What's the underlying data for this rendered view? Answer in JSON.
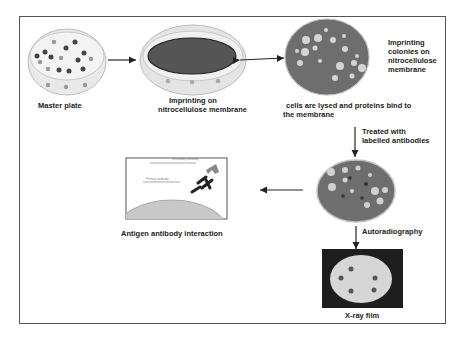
{
  "diagram": {
    "steps": [
      {
        "id": "master",
        "label": "Master plate"
      },
      {
        "id": "imprint",
        "label_line1": "Imprinting on",
        "label_line2": "nitrocellulose membrane"
      },
      {
        "id": "colonies",
        "label_lines": [
          "Imprinting",
          "colonies on",
          "nitrocellulose",
          "membrane"
        ]
      },
      {
        "id": "lysis",
        "label_line1": "cells are lysed and proteins bind to",
        "label_line2": "the membrane"
      },
      {
        "id": "antibodies",
        "label_line1": "Treated with",
        "label_line2": "labelled antibodies"
      },
      {
        "id": "autorad",
        "label": "Autoradiography"
      },
      {
        "id": "xray",
        "label": "X-ray film"
      },
      {
        "id": "interaction",
        "label": "Antigen antibody interaction"
      }
    ],
    "inset": {
      "secondary_label": "Secondary antibody",
      "primary_label": "Primary antibody"
    },
    "colors": {
      "plate_rim": "#d8d8d8",
      "plate_fill": "#ececec",
      "membrane_dark": "#555555",
      "colony_plate": "#6e6e6e",
      "colony_spot": "#cfcfcf",
      "film_bg": "#1e1e1e",
      "film_disc": "#d6d6d6",
      "antigen": "#c8c8c8",
      "frame": "#555555"
    }
  }
}
